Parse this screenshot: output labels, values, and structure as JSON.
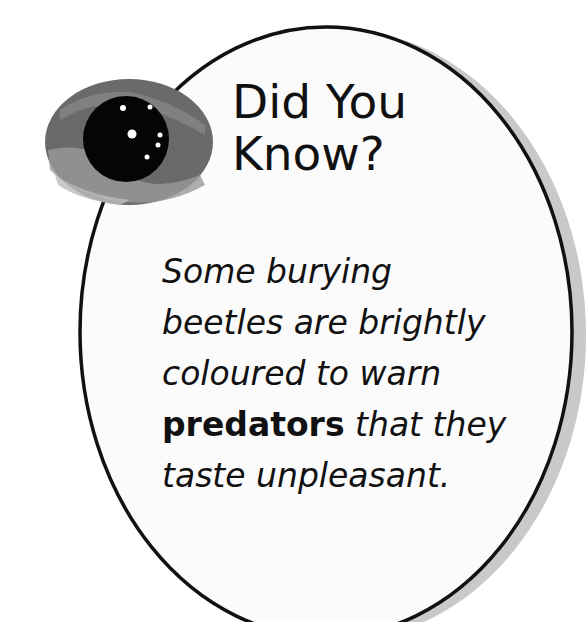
{
  "card": {
    "title_line1": "Did You",
    "title_line2": "Know?",
    "lines": [
      {
        "text": "Some burying"
      },
      {
        "text": "beetles are brightly"
      },
      {
        "text": "coloured to warn"
      },
      {
        "bold": "predators",
        "text": " that they"
      },
      {
        "text": "taste unpleasant."
      }
    ]
  },
  "icon": {
    "name": "eye-icon"
  },
  "colors": {
    "outline": "#111111",
    "shadow": "#c8c8c8",
    "fill": "#fbfbfb"
  }
}
